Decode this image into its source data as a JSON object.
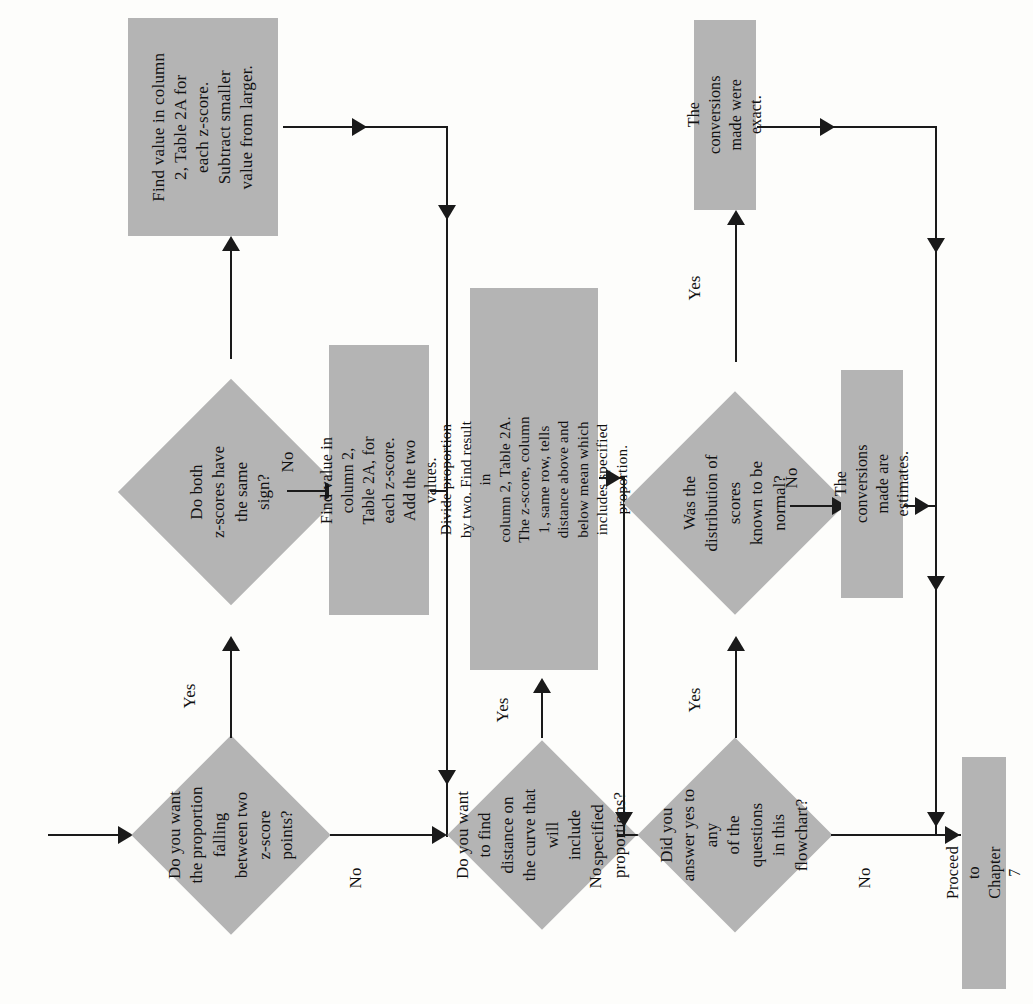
{
  "diagram": {
    "orientation": "rotated-90-ccw",
    "colors": {
      "node_fill": "#b4b4b4",
      "line": "#1a1a1a",
      "text": "#111111",
      "background": "#fdfdfb"
    }
  },
  "nodes": {
    "d1": {
      "type": "decision",
      "text": "Do you want\nthe proportion falling\nbetween two z-score\npoints?"
    },
    "d2": {
      "type": "decision",
      "text": "Do both\nz-scores have\nthe same sign?"
    },
    "p1": {
      "type": "process",
      "text": "Find value in column\n2, Table 2A for\neach z-score.\nSubtract smaller\nvalue from larger."
    },
    "p2": {
      "type": "process",
      "text": "Find value in column 2,\nTable 2A, for each z-score.\nAdd the two values."
    },
    "d3": {
      "type": "decision",
      "text": "Do you want\nto find distance on\nthe curve that will\ninclude specified\nproportions?"
    },
    "p3": {
      "type": "process",
      "text": "Divide proportion by two. Find result in\ncolumn 2, Table 2A. The z-score, column\n1, same row, tells distance above and\nbelow mean which includes specified\nproportion."
    },
    "d4": {
      "type": "decision",
      "text": "Did you\nanswer yes to any\nof the questions\nin this flowchart?"
    },
    "d5": {
      "type": "decision",
      "text": "Was the\ndistribution of scores\nknown to be\nnormal?"
    },
    "p4": {
      "type": "process",
      "text": "The conversions\nmade were exact."
    },
    "p5": {
      "type": "process",
      "text": "The conversions\nmade are estimates."
    },
    "p6": {
      "type": "terminal",
      "text": "Proceed to Chapter 7"
    }
  },
  "edges": {
    "d1_yes": "Yes",
    "d1_no": "No",
    "d2_no": "No",
    "d3_yes": "Yes",
    "d3_no": "No",
    "d4_yes": "Yes",
    "d4_no": "No",
    "d5_yes": "Yes",
    "d5_no": "No"
  }
}
